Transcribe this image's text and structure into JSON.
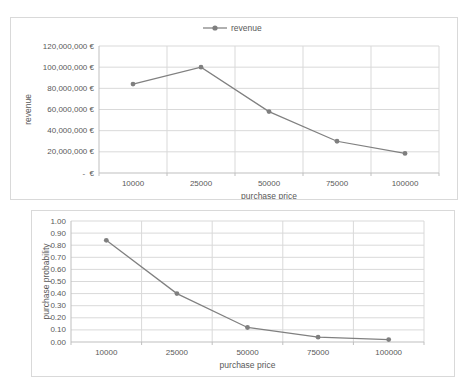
{
  "colors": {
    "series_line": "#808080",
    "marker_fill": "#7f7f7f",
    "grid_line": "#d9d9d9",
    "axis_line": "#bfbfbf",
    "text": "#595959",
    "frame_border": "#d9d9d9",
    "background": "#ffffff"
  },
  "chart_data": [
    {
      "name": "revenue-chart",
      "type": "line",
      "legend": "revenue",
      "legend_position": "top",
      "grid": true,
      "categories": [
        "10000",
        "25000",
        "50000",
        "75000",
        "100000"
      ],
      "values": [
        84000000,
        100000000,
        58000000,
        30000000,
        18500000
      ],
      "xlabel": "purchase price",
      "ylabel": "revenue",
      "ylim": [
        0,
        120000000
      ],
      "ytick_step": 20000000,
      "ytick_labels": [
        "-  €",
        "20,000,000 €",
        "40,000,000 €",
        "60,000,000 €",
        "80,000,000 €",
        "100,000,000 €",
        "120,000,000 €"
      ]
    },
    {
      "name": "probability-chart",
      "type": "line",
      "legend": "",
      "legend_position": "none",
      "grid": true,
      "categories": [
        "10000",
        "25000",
        "50000",
        "75000",
        "100000"
      ],
      "values": [
        0.84,
        0.4,
        0.12,
        0.04,
        0.02
      ],
      "xlabel": "purchase price",
      "ylabel": "purchase probability",
      "ylim": [
        0,
        1
      ],
      "ytick_step": 0.1,
      "ytick_labels": [
        "0.00",
        "0.10",
        "0.20",
        "0.30",
        "0.40",
        "0.50",
        "0.60",
        "0.70",
        "0.80",
        "0.90",
        "1.00"
      ]
    }
  ]
}
